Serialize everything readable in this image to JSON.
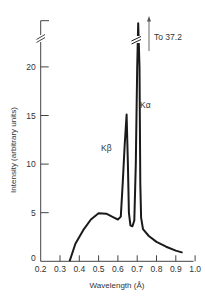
{
  "chart_data": {
    "type": "line",
    "title": "",
    "xlabel": "Wavelength (Å)",
    "ylabel": "Intensity (arbitrary units)",
    "xlim": [
      0.2,
      1.0
    ],
    "ylim": [
      0,
      24.5
    ],
    "grid": false,
    "legend": null,
    "x_ticks": [
      0.2,
      0.3,
      0.4,
      0.5,
      0.6,
      0.7,
      0.8,
      0.9,
      1.0
    ],
    "x_tick_labels": [
      "0.2",
      "0.3",
      "0.4",
      "0.5",
      "0.6",
      "0.7",
      "0.8",
      "0.9",
      "1.0"
    ],
    "y_ticks": [
      0,
      5,
      10,
      15,
      20
    ],
    "y_tick_labels": [
      "0",
      "5",
      "10",
      "15",
      "20"
    ],
    "y_axis_break": true,
    "series": [
      {
        "name": "X-ray spectrum",
        "x": [
          0.35,
          0.38,
          0.42,
          0.46,
          0.5,
          0.54,
          0.58,
          0.6,
          0.615,
          0.625,
          0.635,
          0.645,
          0.652,
          0.657,
          0.665,
          0.675,
          0.685,
          0.693,
          0.7,
          0.705,
          0.712,
          0.716,
          0.72,
          0.73,
          0.76,
          0.8,
          0.85,
          0.9,
          0.935
        ],
        "y": [
          0,
          1.8,
          3.2,
          4.3,
          4.95,
          4.9,
          4.5,
          4.3,
          4.6,
          8,
          12,
          15.1,
          10,
          5,
          3.7,
          3.6,
          4.2,
          10,
          20,
          37.2,
          20,
          8,
          4.5,
          3.3,
          2.6,
          2.0,
          1.5,
          1.1,
          0.9
        ]
      }
    ],
    "peaks": [
      {
        "label": "Kβ",
        "wavelength": 0.64,
        "intensity": 15.1
      },
      {
        "label": "Kα",
        "wavelength": 0.71,
        "intensity": 37.2
      }
    ],
    "annotations": [
      {
        "text": "To 37.2",
        "arrow": "up",
        "target": "Kα"
      },
      {
        "text": "Kα"
      },
      {
        "text": "Kβ"
      }
    ]
  },
  "labels": {
    "x_axis_title": "Wavelength (Å)",
    "y_axis_title": "Intensity (arbitrary units)",
    "ka": "Kα",
    "kb": "Kβ",
    "to_peak": "To 37.2"
  }
}
